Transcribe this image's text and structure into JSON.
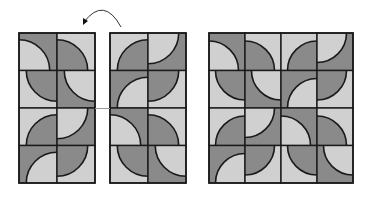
{
  "diagram": {
    "colors": {
      "background": "#ffffff",
      "dark": "#8a8a8a",
      "light": "#d0d0d0",
      "outline": "#1a1a1a"
    },
    "arrow": {
      "meaning": "flip-vertical",
      "from": [
        121,
        27
      ],
      "control": [
        104,
        -4
      ],
      "to": [
        84,
        22
      ]
    },
    "panels": [
      {
        "id": "left-panel",
        "label": "original",
        "x": 19,
        "y": 33,
        "cols": 2,
        "rows": 4,
        "tile_w": 38,
        "tile_h": 37.5,
        "tiles": [
          [
            {
              "base": "dark",
              "corner": "bl"
            },
            {
              "base": "light",
              "corner": "bl"
            }
          ],
          [
            {
              "base": "light",
              "corner": "tr"
            },
            {
              "base": "dark",
              "corner": "tr"
            }
          ],
          [
            {
              "base": "light",
              "corner": "br"
            },
            {
              "base": "dark",
              "corner": "tl"
            }
          ],
          [
            {
              "base": "dark",
              "corner": "br"
            },
            {
              "base": "light",
              "corner": "tl"
            }
          ]
        ]
      },
      {
        "id": "middle-panel",
        "label": "flipped",
        "x": 110,
        "y": 33,
        "cols": 2,
        "rows": 4,
        "tile_w": 38,
        "tile_h": 37.5,
        "tiles": [
          [
            {
              "base": "light",
              "corner": "br"
            },
            {
              "base": "dark",
              "corner": "tl"
            }
          ],
          [
            {
              "base": "dark",
              "corner": "br"
            },
            {
              "base": "light",
              "corner": "tl"
            }
          ],
          [
            {
              "base": "dark",
              "corner": "bl"
            },
            {
              "base": "light",
              "corner": "bl"
            }
          ],
          [
            {
              "base": "light",
              "corner": "tr"
            },
            {
              "base": "dark",
              "corner": "tr"
            }
          ]
        ]
      },
      {
        "id": "right-panel",
        "label": "joined",
        "x": 209,
        "y": 33,
        "cols": 4,
        "rows": 4,
        "tile_w": 36,
        "tile_h": 37.5,
        "tiles": [
          [
            {
              "base": "dark",
              "corner": "bl"
            },
            {
              "base": "light",
              "corner": "bl"
            },
            {
              "base": "light",
              "corner": "br"
            },
            {
              "base": "dark",
              "corner": "tl"
            }
          ],
          [
            {
              "base": "light",
              "corner": "tr"
            },
            {
              "base": "dark",
              "corner": "tr"
            },
            {
              "base": "dark",
              "corner": "br"
            },
            {
              "base": "light",
              "corner": "tl"
            }
          ],
          [
            {
              "base": "light",
              "corner": "br"
            },
            {
              "base": "dark",
              "corner": "tl"
            },
            {
              "base": "dark",
              "corner": "bl"
            },
            {
              "base": "light",
              "corner": "bl"
            }
          ],
          [
            {
              "base": "dark",
              "corner": "br"
            },
            {
              "base": "light",
              "corner": "tl"
            },
            {
              "base": "light",
              "corner": "tr"
            },
            {
              "base": "dark",
              "corner": "tr"
            }
          ]
        ]
      }
    ]
  }
}
